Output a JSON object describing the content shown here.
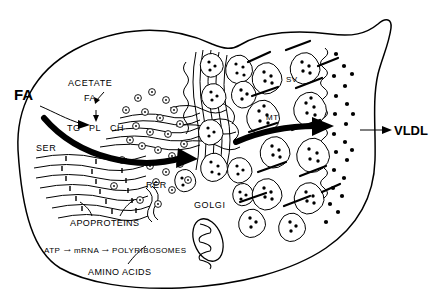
{
  "figure": {
    "background_color": "#ffffff",
    "ink_color": "#000000"
  },
  "labels": {
    "fa_external": "FA",
    "acetate": "ACETATE",
    "fa_internal": "FA",
    "tg": "TG",
    "pl": "PL",
    "ch": "CH",
    "ser": "SER",
    "rer": "RER",
    "golgi": "GOLGI",
    "apoproteins": "APOPROTEINS",
    "atp": "ATP",
    "mrna": "mRNA",
    "polyribosomes": "POLYRIBOSOMES",
    "amino_acids": "AMINO  ACIDS",
    "sv": "SV",
    "mt": "MT",
    "vldl": "VLDL",
    "arrow_glyph_1": "→",
    "arrow_glyph_2": "→"
  },
  "organelles": [
    {
      "name": "smooth-endoplasmic-reticulum",
      "abbr": "SER"
    },
    {
      "name": "rough-endoplasmic-reticulum",
      "abbr": "RER"
    },
    {
      "name": "golgi-apparatus",
      "abbr": "GOLGI"
    },
    {
      "name": "mitochondrion",
      "abbr": ""
    },
    {
      "name": "secretory-vesicle",
      "abbr": "SV"
    },
    {
      "name": "microtubule",
      "abbr": "MT"
    }
  ],
  "pathway": {
    "inputs": [
      "FA",
      "ACETATE",
      "AMINO ACIDS"
    ],
    "output": "VLDL",
    "steps": [
      "ATP",
      "mRNA",
      "POLYRIBOSOMES",
      "APOPROTEINS",
      "RER",
      "SER",
      "GOLGI",
      "SV",
      "VLDL"
    ]
  }
}
